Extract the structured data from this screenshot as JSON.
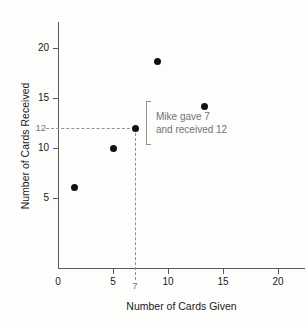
{
  "chart_data": {
    "type": "scatter",
    "title": "",
    "xlabel": "Number of Cards Given",
    "ylabel": "Number of Cards Received",
    "xlim": [
      0,
      22
    ],
    "ylim": [
      0,
      21.5
    ],
    "grid": false,
    "legend": null,
    "xticks": [
      {
        "value": 0,
        "label": "0"
      },
      {
        "value": 5,
        "label": "5"
      },
      {
        "value": 10,
        "label": "10"
      },
      {
        "value": 15,
        "label": "15"
      },
      {
        "value": 20,
        "label": "20"
      }
    ],
    "yticks": [
      {
        "value": 5,
        "label": "5"
      },
      {
        "value": 10,
        "label": "10"
      },
      {
        "value": 15,
        "label": "15"
      },
      {
        "value": 20,
        "label": "20"
      }
    ],
    "points": [
      {
        "x": 1.5,
        "y": 6.1
      },
      {
        "x": 5.0,
        "y": 10.0
      },
      {
        "x": 7.0,
        "y": 12.0
      },
      {
        "x": 9.0,
        "y": 18.7
      },
      {
        "x": 13.3,
        "y": 14.2
      }
    ],
    "highlight": {
      "x": 7,
      "y": 12,
      "x_callout_label": "7",
      "y_callout_label": "12",
      "annotation_line1": "Mike gave 7",
      "annotation_line2": "and received 12"
    },
    "colors": {
      "point": "#111111",
      "axis": "#555a5e",
      "guide": "#8d9195",
      "annotation": "#6f7478",
      "background": "#fdfdfc"
    }
  }
}
